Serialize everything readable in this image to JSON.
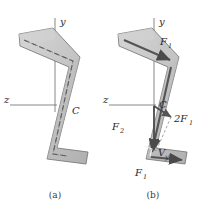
{
  "figure": {
    "type": "engineering-diagram",
    "colors": {
      "section_fill": "#c9c9c9",
      "section_fill_dark": "#a9a9a9",
      "section_outline": "#6e6e6e",
      "centerline": "#6b6b6b",
      "axis": "#6b6b6b",
      "arrow": "#555555",
      "dashed_guide": "#8a8a8a",
      "text": "#2b2b2b",
      "background": "#ffffff"
    },
    "panels": [
      {
        "id": "a",
        "caption": "(a)",
        "axes": [
          {
            "name": "y-axis",
            "label": "y",
            "direction": "up"
          },
          {
            "name": "z-axis",
            "label": "z",
            "direction": "left"
          }
        ],
        "points": [
          {
            "name": "centroid",
            "label": "C"
          }
        ],
        "annotations": []
      },
      {
        "id": "b",
        "caption": "(b)",
        "axes": [
          {
            "name": "y-axis",
            "label": "y",
            "direction": "up"
          },
          {
            "name": "z-axis",
            "label": "z",
            "direction": "left"
          }
        ],
        "points": [
          {
            "name": "centroid",
            "label": "C"
          }
        ],
        "annotations": [
          {
            "name": "top-flange-force",
            "label": "F",
            "sub": "1"
          },
          {
            "name": "web-force",
            "label": "F",
            "sub": "2"
          },
          {
            "name": "bottom-flange-force",
            "label": "F",
            "sub": "1"
          },
          {
            "name": "horizontal-resultant",
            "label": "2F",
            "sub": "1"
          },
          {
            "name": "vertical-shear",
            "label": "V",
            "sub": "y"
          }
        ]
      }
    ]
  }
}
